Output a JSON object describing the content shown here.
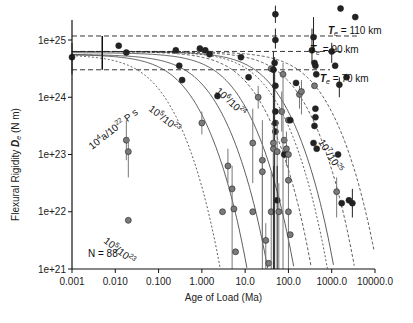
{
  "chart_data": {
    "type": "scatter",
    "title": "",
    "xlabel": "Age of Load (Ma)",
    "ylabel": "Flexural Rigidity D_e (N m)",
    "xscale": "log",
    "yscale": "log",
    "xlim": [
      0.001,
      10000
    ],
    "ylim": [
      1e+21,
      1e+25
    ],
    "x_ticks": [
      "0.001",
      "0.010",
      "0.100",
      "1.000",
      "10.0",
      "100.0",
      "1000.0",
      "10000.0"
    ],
    "y_ticks": [
      "1e+21",
      "1e+22",
      "1e+23",
      "1e+24",
      "1e+25"
    ],
    "grid": false,
    "annotation_n": "N = 88",
    "reference_lines": [
      {
        "label_prefix": "T",
        "label_sub": "e",
        "label_value": "= 110 km",
        "log10_D": 25.07
      },
      {
        "label_prefix": "T",
        "label_sub": "e",
        "label_value": "= 90 km",
        "log10_D": 24.8
      },
      {
        "label_prefix": "T",
        "label_sub": "e",
        "label_value": "= 70 km",
        "log10_D": 24.48
      }
    ],
    "relaxation_curves": [
      {
        "label": "10^4a/10^22 P s",
        "label_base": "10",
        "label_exp1": "4",
        "label_mid": "a/10",
        "label_exp2": "22",
        "label_tail": " P s"
      },
      {
        "label": "10^5/10^23 (lower)",
        "label_base": "10",
        "label_exp1": "5",
        "label_mid": "/10",
        "label_exp2": "23"
      },
      {
        "label": "10^5/10^23",
        "label_base": "10",
        "label_exp1": "5",
        "label_mid": "/10",
        "label_exp2": "23"
      },
      {
        "label": "10^6/10^24",
        "label_base": "10",
        "label_exp1": "6",
        "label_mid": "/10",
        "label_exp2": "24"
      },
      {
        "label": "10^7/10^25",
        "label_base": "10",
        "label_exp1": "7",
        "label_mid": "/10",
        "label_exp2": "25"
      }
    ],
    "points": [
      {
        "x": 0.001,
        "y": 24.7,
        "lo": 24.4,
        "hi": 24.95,
        "dark": true
      },
      {
        "x": 0.012,
        "y": 24.9,
        "dark": true
      },
      {
        "x": 0.018,
        "y": 24.78,
        "dark": true
      },
      {
        "x": 0.018,
        "y": 23.25,
        "lo": 22.9,
        "hi": 23.6,
        "dark": false
      },
      {
        "x": 0.02,
        "y": 23.05,
        "lo": 22.6,
        "hi": 23.3,
        "dark": false
      },
      {
        "x": 0.02,
        "y": 21.85,
        "dark": false
      },
      {
        "x": 0.25,
        "y": 24.82,
        "dark": true
      },
      {
        "x": 0.3,
        "y": 24.55,
        "dark": true
      },
      {
        "x": 0.35,
        "y": 24.3,
        "dark": true
      },
      {
        "x": 0.9,
        "y": 24.85,
        "dark": true
      },
      {
        "x": 1.2,
        "y": 24.82,
        "dark": true
      },
      {
        "x": 1.0,
        "y": 23.55,
        "lo": 23.35,
        "hi": 23.75,
        "dark": false
      },
      {
        "x": 1.5,
        "y": 24.75,
        "dark": true
      },
      {
        "x": 2.3,
        "y": 24.02,
        "dark": true
      },
      {
        "x": 3.0,
        "y": 22.0,
        "dark": false
      },
      {
        "x": 4.0,
        "y": 22.8,
        "lo": 22.5,
        "hi": 23.1,
        "dark": false
      },
      {
        "x": 5.0,
        "y": 22.4,
        "lo": 21.0,
        "hi": 22.8,
        "dark": false
      },
      {
        "x": 5.5,
        "y": 22.05,
        "dark": false
      },
      {
        "x": 6.0,
        "y": 21.3,
        "dark": false
      },
      {
        "x": 8.0,
        "y": 24.7,
        "dark": true
      },
      {
        "x": 12.0,
        "y": 24.35,
        "dark": true
      },
      {
        "x": 15.0,
        "y": 23.2,
        "lo": 22.5,
        "hi": 23.8,
        "dark": false
      },
      {
        "x": 15.0,
        "y": 22.0,
        "dark": false
      },
      {
        "x": 20.0,
        "y": 24.0,
        "lo": 23.8,
        "hi": 24.2,
        "dark": false
      },
      {
        "x": 25.0,
        "y": 22.9,
        "lo": 21.0,
        "hi": 23.6,
        "dark": false
      },
      {
        "x": 25.0,
        "y": 22.7,
        "lo": 21.5,
        "hi": 23.0,
        "dark": false
      },
      {
        "x": 30.0,
        "y": 21.5,
        "lo": 21.0,
        "hi": 21.8,
        "dark": false
      },
      {
        "x": 35.0,
        "y": 21.1,
        "dark": false
      },
      {
        "x": 40.0,
        "y": 24.5,
        "dark": false
      },
      {
        "x": 40.0,
        "y": 22.0,
        "lo": 21.0,
        "hi": 22.7,
        "dark": false
      },
      {
        "x": 45.0,
        "y": 24.48,
        "lo": 21.0,
        "hi": 24.8,
        "dark": true
      },
      {
        "x": 48.0,
        "y": 24.6,
        "lo": 21.0,
        "hi": 24.7,
        "dark": true
      },
      {
        "x": 50.0,
        "y": 25.45,
        "lo": 25.3,
        "hi": 25.6,
        "dark": true
      },
      {
        "x": 50.0,
        "y": 25.0,
        "lo": 24.85,
        "hi": 25.2,
        "dark": true
      },
      {
        "x": 50.0,
        "y": 24.2,
        "dark": true
      },
      {
        "x": 50.0,
        "y": 23.75,
        "dark": true
      },
      {
        "x": 50.0,
        "y": 23.55,
        "dark": true
      },
      {
        "x": 50.0,
        "y": 23.4,
        "dark": true
      },
      {
        "x": 45.0,
        "y": 23.1,
        "dark": false
      },
      {
        "x": 45.0,
        "y": 23.2,
        "lo": 22.8,
        "hi": 23.5,
        "dark": false
      },
      {
        "x": 55.0,
        "y": 23.05,
        "lo": 22.5,
        "hi": 23.6,
        "dark": false
      },
      {
        "x": 55.0,
        "y": 22.2,
        "lo": 21.0,
        "hi": 22.8,
        "dark": true
      },
      {
        "x": 60.0,
        "y": 22.0,
        "lo": 21.0,
        "hi": 22.5,
        "dark": false
      },
      {
        "x": 70.0,
        "y": 23.75,
        "lo": 23.4,
        "hi": 24.1,
        "dark": false
      },
      {
        "x": 75.0,
        "y": 24.4,
        "lo": 21.0,
        "hi": 24.6,
        "dark": false
      },
      {
        "x": 80.0,
        "y": 23.0,
        "dark": true
      },
      {
        "x": 80.0,
        "y": 23.25,
        "dark": false
      },
      {
        "x": 90.0,
        "y": 23.1,
        "lo": 22.8,
        "hi": 23.4,
        "dark": false
      },
      {
        "x": 100.0,
        "y": 22.55,
        "lo": 21.0,
        "hi": 23.0,
        "dark": false
      },
      {
        "x": 100.0,
        "y": 23.6,
        "dark": false
      },
      {
        "x": 100.0,
        "y": 23.0,
        "dark": false
      },
      {
        "x": 100.0,
        "y": 22.0,
        "dark": false
      },
      {
        "x": 110.0,
        "y": 23.6,
        "dark": true
      },
      {
        "x": 110.0,
        "y": 21.6,
        "dark": false
      },
      {
        "x": 150.0,
        "y": 24.25,
        "dark": true
      },
      {
        "x": 180.0,
        "y": 24.05,
        "lo": 23.8,
        "hi": 24.2,
        "dark": false
      },
      {
        "x": 200.0,
        "y": 24.1,
        "lo": 23.7,
        "hi": 24.3,
        "dark": false
      },
      {
        "x": 350.0,
        "y": 24.82,
        "lo": 24.6,
        "hi": 25.2,
        "dark": true
      },
      {
        "x": 380.0,
        "y": 25.05,
        "lo": 24.9,
        "hi": 25.4,
        "dark": true
      },
      {
        "x": 400.0,
        "y": 24.6,
        "dark": true
      },
      {
        "x": 420.0,
        "y": 24.55,
        "dark": true
      },
      {
        "x": 440.0,
        "y": 24.4,
        "dark": true
      },
      {
        "x": 400.0,
        "y": 24.2,
        "dark": false
      },
      {
        "x": 420.0,
        "y": 23.8,
        "dark": true
      },
      {
        "x": 420.0,
        "y": 23.65,
        "dark": true
      },
      {
        "x": 400.0,
        "y": 23.5,
        "dark": true
      },
      {
        "x": 380.0,
        "y": 23.2,
        "dark": true
      },
      {
        "x": 450.0,
        "y": 23.1,
        "dark": true
      },
      {
        "x": 1000.0,
        "y": 24.8,
        "lo": 24.6,
        "hi": 24.95,
        "dark": true
      },
      {
        "x": 1200.0,
        "y": 24.55,
        "dark": true
      },
      {
        "x": 1300.0,
        "y": 22.35,
        "lo": 21.9,
        "hi": 22.6,
        "dark": false
      },
      {
        "x": 1400.0,
        "y": 23.0,
        "dark": true
      },
      {
        "x": 1500.0,
        "y": 24.22,
        "lo": 24.0,
        "hi": 24.35,
        "dark": true
      },
      {
        "x": 1600.0,
        "y": 25.55,
        "dark": true
      },
      {
        "x": 1700.0,
        "y": 22.15,
        "dark": true
      },
      {
        "x": 2200.0,
        "y": 24.35,
        "dark": true
      },
      {
        "x": 2500.0,
        "y": 22.2,
        "dark": true
      },
      {
        "x": 3000.0,
        "y": 22.15,
        "lo": 21.9,
        "hi": 22.4,
        "dark": true
      },
      {
        "x": 3500.0,
        "y": 25.4,
        "dark": true
      }
    ],
    "vertical_bar": {
      "x": 0.005,
      "lo": 24.48,
      "hi": 25.07
    }
  }
}
